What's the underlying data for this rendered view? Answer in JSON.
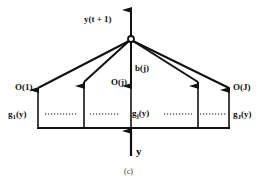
{
  "diagram": {
    "caption": "(c)",
    "output_label": "y(t + 1)",
    "input_label": "y",
    "weight_label": "b(j)",
    "outputs": [
      {
        "label": "O(1)"
      },
      {
        "label": "O(j)"
      },
      {
        "label": "O(J)"
      }
    ],
    "basis_functions": [
      {
        "prefix": "g",
        "sub": "1",
        "suffix": "(y)"
      },
      {
        "prefix": "g",
        "sub": "j",
        "suffix": "(y)"
      },
      {
        "prefix": "g",
        "sub": "J",
        "suffix": "(y)"
      }
    ],
    "colors": {
      "stroke": "#111111",
      "background": "#ffffff"
    }
  }
}
